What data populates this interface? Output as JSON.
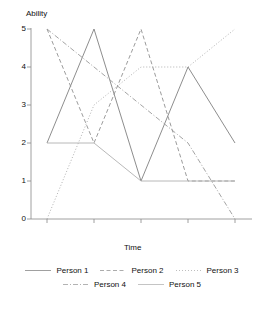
{
  "chart_data": {
    "type": "line",
    "title": "",
    "xlabel": "Time",
    "ylabel": "Ability",
    "x": [
      1,
      2,
      3,
      4,
      5
    ],
    "categories": [
      "1",
      "2",
      "3",
      "4",
      "5"
    ],
    "ylim": [
      0,
      5
    ],
    "yticks": [
      0,
      1,
      2,
      3,
      4,
      5
    ],
    "ytick_labels": [
      "0",
      "1",
      "2",
      "3",
      "4",
      "5"
    ],
    "xticks": [
      1,
      2,
      3,
      4,
      5
    ],
    "xtick_labels": [
      "",
      "",
      "",
      "",
      ""
    ],
    "grid": false,
    "legend_position": "bottom",
    "series": [
      {
        "name": "Person 1",
        "values": [
          2,
          5,
          1,
          4,
          2
        ],
        "style": "solid",
        "color": "#808080"
      },
      {
        "name": "Person 2",
        "values": [
          5,
          2,
          5,
          1,
          1
        ],
        "style": "dashed",
        "color": "#909090"
      },
      {
        "name": "Person 3",
        "values": [
          0,
          3,
          4,
          4,
          5
        ],
        "style": "dotted",
        "color": "#a8a8a8"
      },
      {
        "name": "Person 4",
        "values": [
          5,
          4,
          3,
          2,
          0
        ],
        "style": "dashdot",
        "color": "#9a9a9a"
      },
      {
        "name": "Person 5",
        "values": [
          2,
          2,
          1,
          1,
          1
        ],
        "style": "solid-light",
        "color": "#b0b0b0"
      }
    ]
  },
  "legend": {
    "rows": [
      [
        {
          "label": "Person 1",
          "swatch": "solid"
        },
        {
          "label": "Person 2",
          "swatch": "dashed"
        },
        {
          "label": "Person 3",
          "swatch": "dotted"
        }
      ],
      [
        {
          "label": "Person 4",
          "swatch": "dashdot"
        },
        {
          "label": "Person 5",
          "swatch": "solid-light"
        }
      ]
    ]
  },
  "axes": {
    "y_title": "Ability",
    "x_title": "Time",
    "y_tick_0": "0",
    "y_tick_1": "1",
    "y_tick_2": "2",
    "y_tick_3": "3",
    "y_tick_4": "4",
    "y_tick_5": "5"
  }
}
